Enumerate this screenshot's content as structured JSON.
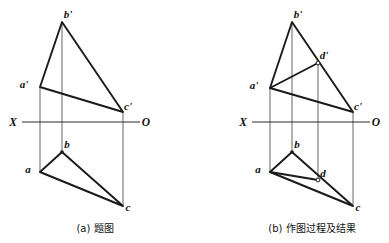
{
  "figure": {
    "background_color": "#ffffff",
    "line_color": "#1a1a1a",
    "thin_line_color": "#4a4a4a",
    "axis_label_left": "X",
    "axis_label_right": "O"
  },
  "panels": [
    {
      "id": "panel-a",
      "caption": "(a) 题图",
      "axis": {
        "left_label": "X",
        "right_label": "O",
        "y": 122,
        "x_start": 22,
        "x_end": 140,
        "left_label_x": 13,
        "right_label_x": 146
      },
      "points": [
        {
          "name": "b-prime",
          "label": "b'",
          "x": 62,
          "y": 22,
          "marker": "none",
          "label_dx": 6,
          "label_dy": -4
        },
        {
          "name": "a-prime",
          "label": "a'",
          "x": 40,
          "y": 87,
          "marker": "none",
          "label_dx": -16,
          "label_dy": 1
        },
        {
          "name": "c-prime",
          "label": "c'",
          "x": 123,
          "y": 112,
          "marker": "none",
          "label_dx": 5,
          "label_dy": -2
        },
        {
          "name": "b",
          "label": "b",
          "x": 62,
          "y": 152,
          "marker": "dot",
          "label_dx": 5,
          "label_dy": -4
        },
        {
          "name": "a",
          "label": "a",
          "x": 40,
          "y": 172,
          "marker": "none",
          "label_dx": -12,
          "label_dy": 1
        },
        {
          "name": "c",
          "label": "c",
          "x": 123,
          "y": 206,
          "marker": "none",
          "label_dx": 5,
          "label_dy": 5
        }
      ],
      "upper_triangle": "62,22 40,87 123,112",
      "lower_triangle": "62,152 40,172 123,206",
      "projection_lines": [
        {
          "name": "projector-a",
          "x": 40,
          "y1": 87,
          "y2": 172
        },
        {
          "name": "projector-b",
          "x": 62,
          "y1": 22,
          "y2": 152
        },
        {
          "name": "projector-c",
          "x": 123,
          "y1": 112,
          "y2": 206
        }
      ],
      "caption_x": 95,
      "caption_y": 232
    },
    {
      "id": "panel-b",
      "caption": "(b) 作图过程及结果",
      "axis": {
        "left_label": "X",
        "right_label": "O",
        "y": 122,
        "x_start": 252,
        "x_end": 370,
        "left_label_x": 243,
        "right_label_x": 376
      },
      "points": [
        {
          "name": "b-prime",
          "label": "b'",
          "x": 292,
          "y": 22,
          "marker": "none",
          "label_dx": 6,
          "label_dy": -4
        },
        {
          "name": "d-prime",
          "label": "d'",
          "x": 318,
          "y": 63,
          "marker": "ring",
          "label_dx": 6,
          "label_dy": -4
        },
        {
          "name": "a-prime",
          "label": "a'",
          "x": 270,
          "y": 88,
          "marker": "none",
          "label_dx": -16,
          "label_dy": 1
        },
        {
          "name": "c-prime",
          "label": "c'",
          "x": 353,
          "y": 112,
          "marker": "none",
          "label_dx": 5,
          "label_dy": -2
        },
        {
          "name": "b",
          "label": "b",
          "x": 292,
          "y": 152,
          "marker": "dot",
          "label_dx": 5,
          "label_dy": -4
        },
        {
          "name": "a",
          "label": "a",
          "x": 270,
          "y": 172,
          "marker": "none",
          "label_dx": -12,
          "label_dy": 1
        },
        {
          "name": "d",
          "label": "d",
          "x": 318,
          "y": 180,
          "marker": "ring",
          "label_dx": 5,
          "label_dy": -3
        },
        {
          "name": "c",
          "label": "c",
          "x": 353,
          "y": 206,
          "marker": "none",
          "label_dx": 5,
          "label_dy": 5
        }
      ],
      "upper_triangle": "292,22 270,88 353,112",
      "lower_triangle": "292,152 270,172 353,206",
      "construction_edges": [
        {
          "name": "edge-aprime-dprime",
          "x1": 270,
          "y1": 88,
          "x2": 318,
          "y2": 63
        },
        {
          "name": "edge-a-d",
          "x1": 270,
          "y1": 172,
          "x2": 318,
          "y2": 180
        }
      ],
      "projection_lines": [
        {
          "name": "projector-a",
          "x": 270,
          "y1": 88,
          "y2": 172
        },
        {
          "name": "projector-b",
          "x": 292,
          "y1": 22,
          "y2": 152
        },
        {
          "name": "projector-d",
          "x": 318,
          "y1": 63,
          "y2": 180
        },
        {
          "name": "projector-c",
          "x": 353,
          "y1": 112,
          "y2": 206
        }
      ],
      "caption_x": 312,
      "caption_y": 232
    }
  ]
}
